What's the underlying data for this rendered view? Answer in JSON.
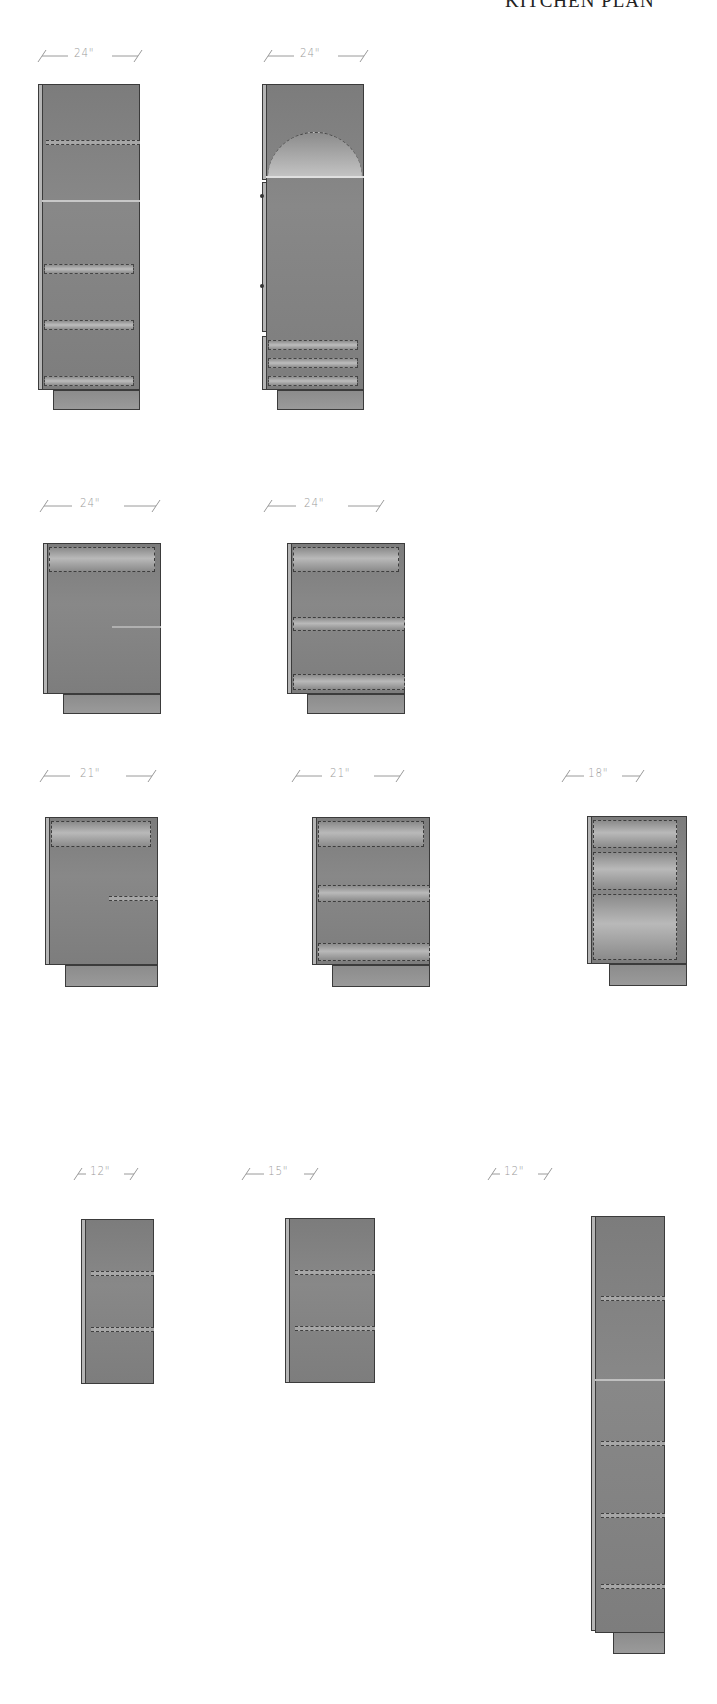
{
  "sheet": {
    "title": "KITCHEN PLAN",
    "background": "#ffffff",
    "cabinet_color": "#808080",
    "dimension_color": "#9a9a9a"
  },
  "rows": [
    {
      "name": "tall-cabinets",
      "cabinets": [
        {
          "id": "tall-pantry-1",
          "width_label": "24\"",
          "type": "tall pantry",
          "features": [
            "upper door with dashed shelf",
            "door split line",
            "3 drawer-style rails"
          ]
        },
        {
          "id": "tall-oven",
          "width_label": "24\"",
          "type": "tall oven cabinet",
          "features": [
            "arched appliance opening",
            "full door",
            "3 bottom drawers"
          ]
        }
      ]
    },
    {
      "name": "base-24",
      "cabinets": [
        {
          "id": "base-24-a",
          "width_label": "24\"",
          "type": "base cabinet",
          "features": [
            "top drawer",
            "dashed shelf"
          ]
        },
        {
          "id": "base-24-b",
          "width_label": "24\"",
          "type": "drawer base",
          "features": [
            "top drawer",
            "middle drawer",
            "bottom drawer"
          ]
        }
      ]
    },
    {
      "name": "base-21-18",
      "cabinets": [
        {
          "id": "base-21-a",
          "width_label": "21\"",
          "type": "base cabinet",
          "features": [
            "top drawer",
            "dashed shelf"
          ]
        },
        {
          "id": "base-21-b",
          "width_label": "21\"",
          "type": "drawer base",
          "features": [
            "top drawer",
            "middle drawer",
            "bottom drawer"
          ]
        },
        {
          "id": "base-18",
          "width_label": "18\"",
          "type": "drawer base",
          "features": [
            "top drawer",
            "middle drawer",
            "deep bottom drawer"
          ]
        }
      ]
    },
    {
      "name": "wall-and-tall",
      "cabinets": [
        {
          "id": "wall-12",
          "width_label": "12\"",
          "type": "wall cabinet",
          "features": [
            "2 dashed shelves"
          ]
        },
        {
          "id": "wall-15",
          "width_label": "15\"",
          "type": "wall cabinet",
          "features": [
            "2 dashed shelves"
          ]
        },
        {
          "id": "tall-12",
          "width_label": "12\"",
          "type": "tall narrow cabinet",
          "features": [
            "upper shelf",
            "door split",
            "3 lower shelves"
          ]
        }
      ]
    }
  ]
}
